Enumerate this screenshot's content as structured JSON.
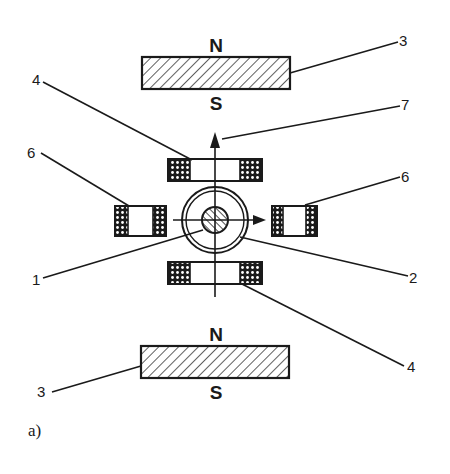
{
  "figure": {
    "caption": "a)",
    "magnets": {
      "top": {
        "north_label": "N",
        "south_label": "S",
        "callout": "3"
      },
      "bottom": {
        "north_label": "N",
        "south_label": "S",
        "callout": "3"
      }
    },
    "callouts": {
      "c1": "1",
      "c2": "2",
      "c3_top": "3",
      "c3_bottom": "3",
      "c4_top": "4",
      "c4_bottom": "4",
      "c6_left": "6",
      "c6_right": "6",
      "c7": "7"
    },
    "colors": {
      "ink": "#1a1a1a",
      "background": "#ffffff"
    }
  }
}
